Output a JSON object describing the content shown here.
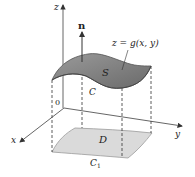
{
  "figure": {
    "labels": {
      "z_axis": "z",
      "x_axis": "x",
      "y_axis": "y",
      "origin": "0",
      "normal": "n",
      "surface": "S",
      "surface_equation": "z = g(x, y)",
      "boundary_curve": "C",
      "region": "D",
      "projected_curve_main": "C",
      "projected_curve_sub": "1"
    },
    "colors": {
      "surface_fill": "#8a8a8a",
      "surface_dark": "#6e6e6e",
      "region_fill": "#d9d9d9",
      "axis_stroke": "#444444",
      "dash_stroke": "#333333"
    }
  }
}
